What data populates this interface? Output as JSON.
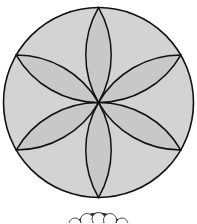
{
  "figure": {
    "circle": {
      "cx": 98.5,
      "cy": 102.5,
      "r": 95,
      "fill": "#d3d3d3",
      "stroke": "#111111"
    },
    "petal_fill": "#c9c9c9",
    "petal_count": 6,
    "petal_tips": [
      [
        98.5,
        7.5
      ],
      [
        180.8,
        55
      ],
      [
        180.8,
        150
      ],
      [
        98.5,
        197.5
      ],
      [
        16.2,
        150
      ],
      [
        16.2,
        55
      ]
    ],
    "partial_figure": {
      "cx": 98.5,
      "top": 213,
      "fill": "#333333",
      "hole_fill": "#ffffff"
    }
  }
}
